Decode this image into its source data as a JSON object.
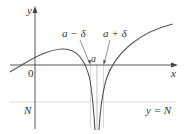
{
  "diagram": {
    "type": "limit-definition-infinite",
    "axes": {
      "x_label": "x",
      "y_label": "y",
      "origin_label": "0"
    },
    "labels": {
      "a_minus_delta": "a − δ",
      "a_plus_delta": "a + δ",
      "a": "a",
      "N": "N",
      "y_equals_N": "y = N"
    },
    "colors": {
      "curve": "#555555",
      "axis": "#333333",
      "guide_line": "#cccccc",
      "delta_lines": "#bbbbbb"
    }
  }
}
